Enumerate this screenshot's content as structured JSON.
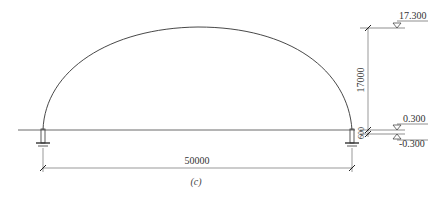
{
  "diagram": {
    "caption": "(c)",
    "span_dimension": "50000",
    "rise_dimension": "17000",
    "base_dimension": "600",
    "levels": {
      "top": "17.300",
      "upper_base": "0.300",
      "lower_base": "-0.300"
    },
    "colors": {
      "line": "#333333",
      "dim_line": "#555555",
      "background": "#ffffff"
    }
  }
}
